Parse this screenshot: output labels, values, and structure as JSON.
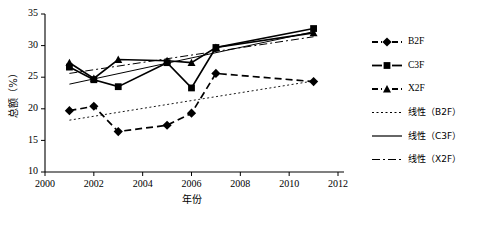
{
  "chart_data": {
    "type": "line",
    "title": "",
    "xlabel": "年份",
    "ylabel": "总额（%）",
    "xlim": [
      2000,
      2012
    ],
    "ylim": [
      10,
      35
    ],
    "xticks": [
      2000,
      2002,
      2004,
      2006,
      2008,
      2010,
      2012
    ],
    "yticks": [
      10,
      15,
      20,
      25,
      30,
      35
    ],
    "grid": false,
    "legend_position": "right",
    "x": [
      2001,
      2002,
      2003,
      2005,
      2006,
      2007,
      2011
    ],
    "series": [
      {
        "name": "B2F",
        "marker": "diamond",
        "linestyle": "dashed",
        "color": "#000000",
        "values": [
          19.7,
          20.4,
          16.4,
          17.4,
          19.3,
          25.6,
          24.3
        ]
      },
      {
        "name": "C3F",
        "marker": "square",
        "linestyle": "solid",
        "color": "#000000",
        "values": [
          26.6,
          24.6,
          23.5,
          27.3,
          23.3,
          29.7,
          32.7
        ]
      },
      {
        "name": "X2F",
        "marker": "triangle",
        "linestyle": "solid",
        "color": "#000000",
        "values": [
          27.3,
          24.8,
          27.8,
          27.6,
          27.3,
          29.7,
          32.0
        ]
      }
    ],
    "trendlines": [
      {
        "name": "线性（B2F）",
        "linestyle": "dotted",
        "color": "#000000",
        "x0": 2001,
        "y0": 18.2,
        "x1": 2011,
        "y1": 24.4
      },
      {
        "name": "线性（C3F）",
        "linestyle": "solid",
        "color": "#000000",
        "x0": 2001,
        "y0": 23.9,
        "x1": 2011,
        "y1": 32.2
      },
      {
        "name": "线性（X2F）",
        "linestyle": "dashdot",
        "color": "#000000",
        "x0": 2001,
        "y0": 25.6,
        "x1": 2011,
        "y1": 31.4
      }
    ],
    "legend": [
      {
        "label": "B2F",
        "kind": "series",
        "marker": "diamond",
        "linestyle": "dashed"
      },
      {
        "label": "C3F",
        "kind": "series",
        "marker": "square",
        "linestyle": "solid"
      },
      {
        "label": "X2F",
        "kind": "series",
        "marker": "triangle",
        "linestyle": "dashed"
      },
      {
        "label": "线性（B2F）",
        "kind": "trend",
        "marker": "none",
        "linestyle": "dotted"
      },
      {
        "label": "线性（C3F）",
        "kind": "trend",
        "marker": "none",
        "linestyle": "solid"
      },
      {
        "label": "线性（X2F）",
        "kind": "trend",
        "marker": "none",
        "linestyle": "dashdot"
      }
    ]
  }
}
